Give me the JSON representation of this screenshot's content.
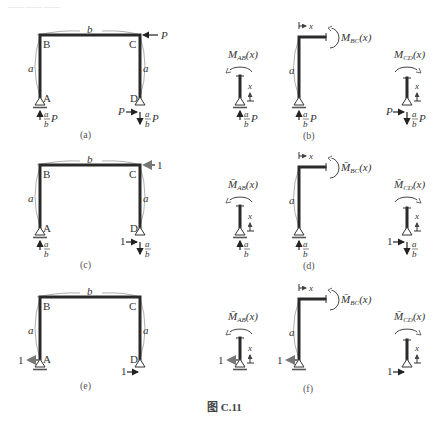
{
  "header_fragment": "—— —— ——",
  "figure_caption": "图 C.11",
  "dimensions": {
    "width": "b",
    "height": "a"
  },
  "nodes": {
    "A": "A",
    "B": "B",
    "C": "C",
    "D": "D"
  },
  "panels": {
    "a": {
      "caption": "(a)",
      "load_C": "P",
      "reaction_A_vertical": "a/b P",
      "reaction_D_horizontal": "P",
      "reaction_D_vertical": "a/b P"
    },
    "b": {
      "caption": "(b)",
      "moment_AB": "M_AB(x)",
      "moment_BC": "M_BC(x)",
      "moment_CD": "M_CD(x)",
      "coord": "x",
      "reaction": "a/b P",
      "reaction_D_horizontal": "P"
    },
    "c": {
      "caption": "(c)",
      "load_C": "1",
      "reaction_A_vertical": "a/b",
      "reaction_D_horizontal": "1",
      "reaction_D_vertical": "a/b"
    },
    "d": {
      "caption": "(d)",
      "moment_AB": "M̄_AB(x)",
      "moment_BC": "M̄_BC(x)",
      "moment_CD": "M̄_CD(x)",
      "coord": "x",
      "reaction": "a/b",
      "reaction_D_horizontal": "1"
    },
    "e": {
      "caption": "(e)",
      "load_A": "1",
      "load_D": "1"
    },
    "f": {
      "caption": "(f)",
      "moment_AB": "M̄_AB(x)",
      "moment_BC": "M̄_BC(x)",
      "moment_CD": "M̄_CD(x)",
      "coord": "x",
      "load": "1"
    }
  },
  "text": {
    "a": "a",
    "b": "b",
    "P": "P",
    "x": "x",
    "one": "1",
    "M": "M",
    "Mbar": "M̄",
    "AB": "AB",
    "BC": "BC",
    "CD": "CD",
    "paren_x": "(x)",
    "cap_a": "(a)",
    "cap_b": "(b)",
    "cap_c": "(c)",
    "cap_d": "(d)",
    "cap_e": "(e)",
    "cap_f": "(f)"
  }
}
